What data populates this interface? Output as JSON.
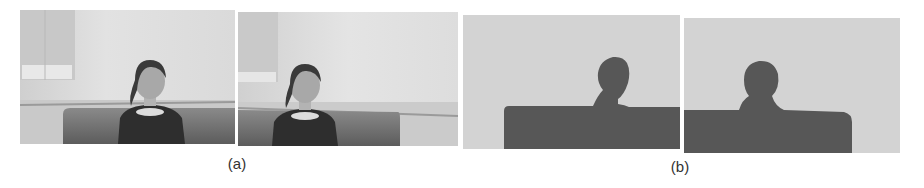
{
  "figure": {
    "panels": [
      {
        "label": "(a)",
        "description": "Original video frames: woman seated on a sofa in a white room",
        "frames": [
          {
            "name": "frame-a1",
            "content": "woman-on-sofa"
          },
          {
            "name": "frame-a2",
            "content": "woman-on-sofa"
          }
        ]
      },
      {
        "label": "(b)",
        "description": "Segmented foreground silhouettes (person + sofa) on light gray background",
        "frames": [
          {
            "name": "frame-b1",
            "content": "silhouette"
          },
          {
            "name": "frame-b2",
            "content": "silhouette"
          }
        ]
      }
    ],
    "colors": {
      "background": "#ffffff",
      "wall": "#d9d9d9",
      "sofa": "#6e6e6e",
      "clothing": "#2e2e2e",
      "silhouette": "#575757",
      "mask_background": "#d3d3d3"
    }
  }
}
